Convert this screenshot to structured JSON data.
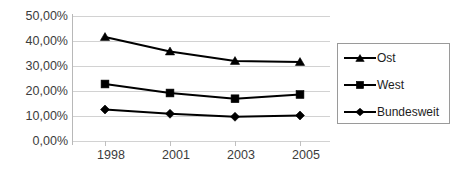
{
  "chart_data": {
    "type": "line",
    "title": "",
    "xlabel": "",
    "ylabel": "",
    "categories": [
      "1998",
      "2001",
      "2003",
      "2005"
    ],
    "ylim": [
      0,
      50
    ],
    "ytick_values": [
      0,
      10,
      20,
      30,
      40,
      50
    ],
    "ytick_labels": [
      "0,00%",
      "10,00%",
      "20,00%",
      "30,00%",
      "40,00%",
      "50,00%"
    ],
    "grid": true,
    "legend_position": "right",
    "series": [
      {
        "name": "Ost",
        "marker": "triangle",
        "color": "#000000",
        "values": [
          41.6,
          35.8,
          32.0,
          31.6
        ]
      },
      {
        "name": "West",
        "marker": "square",
        "color": "#000000",
        "values": [
          22.8,
          19.2,
          16.9,
          18.6
        ]
      },
      {
        "name": "Bundesweit",
        "marker": "diamond",
        "color": "#000000",
        "values": [
          12.6,
          10.9,
          9.7,
          10.2
        ]
      }
    ]
  },
  "legend": {
    "entries": [
      {
        "label": "Ost"
      },
      {
        "label": "West"
      },
      {
        "label": "Bundesweit"
      }
    ]
  },
  "axis": {
    "y_labels": [
      "50,00%",
      "40,00%",
      "30,00%",
      "20,00%",
      "10,00%",
      "0,00%"
    ],
    "x_labels": [
      "1998",
      "2001",
      "2003",
      "2005"
    ]
  },
  "colors": {
    "series": "#000000",
    "gridline": "#d2d2d2",
    "axis": "#b8b8b8",
    "legend_border": "#9a9a9a",
    "background": "#ffffff",
    "tick_text": "#3c3c3c"
  }
}
